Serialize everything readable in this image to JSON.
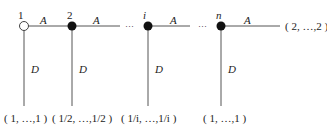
{
  "diagram": {
    "nodes": [
      {
        "label": "1",
        "filled": false
      },
      {
        "label": "2",
        "filled": true
      },
      {
        "label": "i",
        "filled": true
      },
      {
        "label": "n",
        "filled": true
      }
    ],
    "edge_labels": {
      "horizontal": "A",
      "vertical": "D"
    },
    "ellipsis": "···",
    "right_end_label": "( 2, …,2 )",
    "bottom_labels": [
      "( 1, …,1 )",
      "( 1/2, …,1/2 )",
      "( 1/i, …,1/i )",
      "( 1, …,1 )"
    ],
    "colors": {
      "line": "#555555",
      "node_fill": "#111111"
    }
  }
}
